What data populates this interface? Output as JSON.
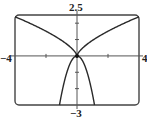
{
  "chart_data": {
    "type": "line",
    "title": "",
    "xlabel": "",
    "ylabel": "",
    "xlim": [
      -4,
      4
    ],
    "ylim": [
      -3,
      2.5
    ],
    "x_tick_marks": [
      -2,
      2
    ],
    "y_tick_marks": [
      -2,
      -1,
      1,
      2
    ],
    "labels": {
      "xmin": "−4",
      "xmax": "4",
      "ymax": "2.5",
      "ymin": "−3"
    },
    "grid": false,
    "legend": null,
    "series": [
      {
        "name": "upper-branches",
        "description": "y ≈ 0.95·|x|^(2/3), cusp at origin",
        "x": [
          -4,
          -3,
          -2,
          -1,
          -0.5,
          0,
          0.5,
          1,
          2,
          3,
          4
        ],
        "y": [
          2.39,
          1.98,
          1.51,
          0.95,
          0.6,
          0,
          0.6,
          0.95,
          1.51,
          1.98,
          2.39
        ]
      },
      {
        "name": "lower-branch",
        "description": "y ≈ -2.35·x², downward parabola through origin",
        "x": [
          -1.13,
          -1,
          -0.65,
          -0.5,
          0,
          0.5,
          0.65,
          1,
          1.13
        ],
        "y": [
          -3,
          -2.35,
          -1,
          -0.59,
          0,
          -0.59,
          -1,
          -2.35,
          -3
        ]
      }
    ],
    "annotations": [
      {
        "type": "point",
        "x": 0,
        "y": 0,
        "label": "origin dot"
      }
    ]
  },
  "colors": {
    "curve": "#2a2a2a",
    "axis": "#555555",
    "frame": "#444444"
  }
}
